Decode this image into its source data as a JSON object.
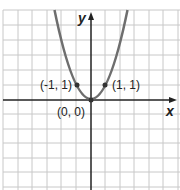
{
  "graph": {
    "function": "y = x^2",
    "x_axis_label": "x",
    "y_axis_label": "y",
    "points": [
      {
        "label": "(-1, 1)",
        "x": -1,
        "y": 1
      },
      {
        "label": "(0, 0)",
        "x": 0,
        "y": 0
      },
      {
        "label": "(1, 1)",
        "x": 1,
        "y": 1
      }
    ],
    "grid": {
      "x_range": [
        -6,
        6
      ],
      "y_range": [
        -6,
        6
      ]
    },
    "colors": {
      "curve": "#6e6e6e",
      "axes": "#222222",
      "grid": "#c8c8c8"
    }
  }
}
